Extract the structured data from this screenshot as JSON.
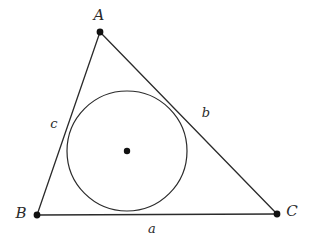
{
  "figure": {
    "background_color": "#ffffff",
    "stroke_color": "#2b2b2b",
    "point_color": "#111111"
  },
  "vertices": [
    {
      "id": "A",
      "label": "A",
      "x": 100,
      "y": 32,
      "label_x": 99,
      "label_y": 16
    },
    {
      "id": "B",
      "label": "B",
      "x": 37,
      "y": 215,
      "label_x": 21,
      "label_y": 214
    },
    {
      "id": "C",
      "label": "C",
      "x": 277,
      "y": 214,
      "label_x": 292,
      "label_y": 212
    }
  ],
  "sides": [
    {
      "id": "a",
      "label": "a",
      "from": "B",
      "to": "C",
      "label_x": 152,
      "label_y": 229
    },
    {
      "id": "b",
      "label": "b",
      "from": "A",
      "to": "C",
      "label_x": 206,
      "label_y": 113
    },
    {
      "id": "c",
      "label": "c",
      "from": "A",
      "to": "B",
      "label_x": 54,
      "label_y": 124
    }
  ],
  "incircle": {
    "center_label": "incenter",
    "center_x": 127,
    "center_y": 151,
    "radius": 60
  }
}
